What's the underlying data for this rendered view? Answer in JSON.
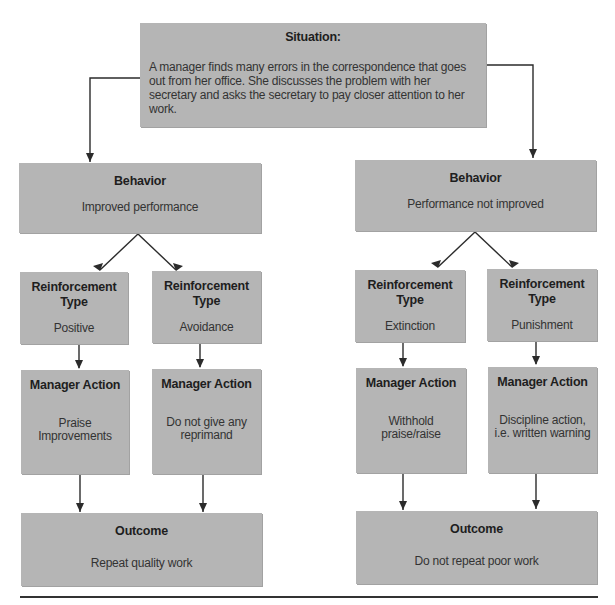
{
  "header_fragment": "Reinforcement strategy applied to a specific situation",
  "situation": {
    "title": "Situation:",
    "text": "A manager finds many errors in the correspondence that goes out from her office. She discusses the problem with her secretary and asks the secretary to pay closer attention to her work."
  },
  "branches": [
    {
      "behavior": {
        "title": "Behavior",
        "text": "Improved performance"
      },
      "paths": [
        {
          "reinforcement": {
            "title": "Reinforcement Type",
            "text": "Positive"
          },
          "action": {
            "title": "Manager Action",
            "text": "Praise Improvements"
          }
        },
        {
          "reinforcement": {
            "title": "Reinforcement Type",
            "text": "Avoidance"
          },
          "action": {
            "title": "Manager Action",
            "text": "Do not give any reprimand"
          }
        }
      ],
      "outcome": {
        "title": "Outcome",
        "text": "Repeat quality work"
      }
    },
    {
      "behavior": {
        "title": "Behavior",
        "text": "Performance not improved"
      },
      "paths": [
        {
          "reinforcement": {
            "title": "Reinforcement Type",
            "text": "Extinction"
          },
          "action": {
            "title": "Manager Action",
            "text": "Withhold praise/raise"
          }
        },
        {
          "reinforcement": {
            "title": "Reinforcement Type",
            "text": "Punishment"
          },
          "action": {
            "title": "Manager Action",
            "text": "Discipline action, i.e. written warning"
          }
        }
      ],
      "outcome": {
        "title": "Outcome",
        "text": "Do not repeat poor work"
      }
    }
  ],
  "colors": {
    "box_fill": "#b5b5b5",
    "line": "#2b2b2b",
    "text": "#2b2b2b"
  }
}
